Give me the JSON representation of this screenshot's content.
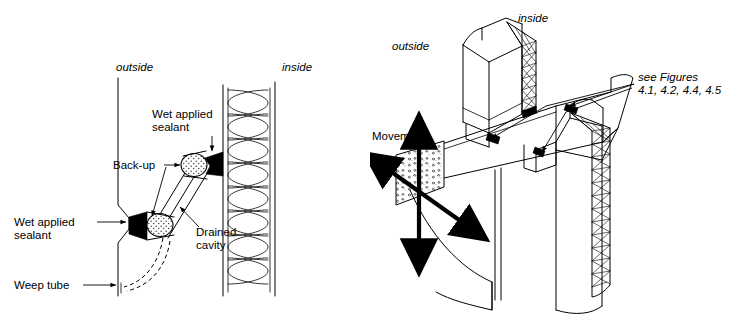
{
  "document": {
    "type": "technical-architectural-detail-figure",
    "background_color": "#ffffff",
    "line_color": "#000000",
    "width": 743,
    "height": 320
  },
  "panels": [
    {
      "id": "left",
      "name": "wall-section-sealant-joint-detail",
      "view": "vertical section through exterior wall joint",
      "orientation_labels": [
        {
          "text": "outside",
          "style": "italic",
          "x": 116,
          "y": 71
        },
        {
          "text": "inside",
          "style": "italic",
          "x": 282,
          "y": 71
        }
      ],
      "callouts": [
        {
          "text_lines": [
            "Wet applied",
            "sealant"
          ],
          "x": 152,
          "y": 118,
          "align": "start",
          "leader": "down-arrow"
        },
        {
          "text_lines": [
            "Back-up"
          ],
          "x": 113,
          "y": 165,
          "align": "start",
          "leader": "right-arrow-branching"
        },
        {
          "text_lines": [
            "Wet applied",
            "sealant"
          ],
          "x": 14,
          "y": 226,
          "align": "start",
          "leader": "right-arrow"
        },
        {
          "text_lines": [
            "Drained",
            "cavity"
          ],
          "x": 196,
          "y": 231,
          "align": "start",
          "leader": "up-left-arrow"
        },
        {
          "text_lines": [
            "Weep tube"
          ],
          "x": 14,
          "y": 285,
          "align": "start",
          "leader": "right-arrow"
        }
      ],
      "elements": [
        "exterior-cladding-line",
        "interior-wall-lines",
        "batt-insulation-cavity",
        "upper-sealant-joint",
        "lower-sealant-joint",
        "backer-rod-upper",
        "backer-rod-lower",
        "drained-cavity-channel",
        "weep-tube-dashed-curve"
      ]
    },
    {
      "id": "right",
      "name": "axonometric-wall-beam-junction",
      "view": "isometric cutaway of wall and spandrel beam",
      "orientation_labels": [
        {
          "text": "outside",
          "style": "italic",
          "x": 22,
          "y": 50
        },
        {
          "text": "inside",
          "style": "italic",
          "x": 148,
          "y": 22
        }
      ],
      "callouts": [
        {
          "text_lines": [
            "Movement"
          ],
          "x": 2,
          "y": 137,
          "align": "start",
          "style": "normal"
        },
        {
          "text_lines": [
            "see Figures",
            "4.1, 4.2, 4.4, 4.5"
          ],
          "x": 268,
          "y": 81,
          "align": "start",
          "style": "italic"
        }
      ],
      "arrows": [
        {
          "name": "vertical-movement-arrow",
          "type": "double-headed",
          "direction": "vertical"
        },
        {
          "name": "diagonal-movement-arrow",
          "type": "double-headed",
          "direction": "diagonal-down-right"
        }
      ],
      "elements": [
        "upper-wall-block",
        "cross-hatched-insulation-upper",
        "cross-hatched-insulation-lower",
        "spandrel-beam",
        "concrete-stipple-block",
        "lower-wall-block",
        "joint-markers",
        "leader-lines"
      ]
    }
  ]
}
